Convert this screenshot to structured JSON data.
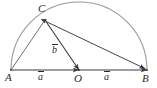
{
  "figure": {
    "background_color": "#ffffff",
    "arc_color": "#9a9a9a",
    "line_color": "#3a3a3a",
    "text_color": "#2b2b2b",
    "points": [
      {
        "id": "A",
        "label": "A",
        "x": 11,
        "y": 70,
        "label_x": 5,
        "label_y": 72
      },
      {
        "id": "O",
        "label": "O",
        "x": 79,
        "y": 70,
        "label_x": 74,
        "label_y": 73
      },
      {
        "id": "B",
        "label": "B",
        "x": 147,
        "y": 70,
        "label_x": 142,
        "label_y": 73
      },
      {
        "id": "C",
        "label": "C",
        "x": 45,
        "y": 20,
        "label_x": 38,
        "label_y": 3
      }
    ],
    "vectors": [
      {
        "id": "a1",
        "label": "a",
        "from": "A",
        "to": "O",
        "label_x": 38,
        "label_y": 72
      },
      {
        "id": "a2",
        "label": "a",
        "from": "O",
        "to": "B",
        "label_x": 104,
        "label_y": 72
      },
      {
        "id": "b",
        "label": "b",
        "from": "C",
        "to": "O",
        "label_x": 52,
        "label_y": 45
      }
    ],
    "segments": [
      {
        "id": "AC",
        "from": "A",
        "to": "C",
        "arrow": "none"
      },
      {
        "id": "CB",
        "from": "C",
        "to": "B",
        "arrow": "both"
      }
    ],
    "arc": {
      "id": "semicircle-AB",
      "center_x": 79,
      "center_y": 70,
      "radius": 68,
      "start_angle_deg": 180,
      "end_angle_deg": 0
    }
  }
}
